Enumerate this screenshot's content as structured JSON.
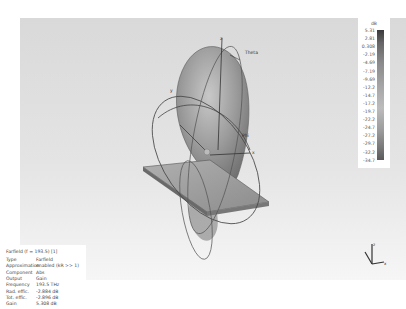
{
  "viewport": {
    "axis_labels": {
      "x": "x",
      "y": "y",
      "z": "z",
      "theta": "Theta",
      "phi": "Phi"
    }
  },
  "legend": {
    "unit": "dB",
    "ticks": [
      "5.31",
      "2.81",
      "0.308",
      "-2.19",
      "-4.69",
      "-7.19",
      "-9.69",
      "-12.2",
      "-14.7",
      "-17.2",
      "-19.7",
      "-22.2",
      "-24.7",
      "-27.2",
      "-29.7",
      "-32.2",
      "-34.7"
    ]
  },
  "info_panel": {
    "title": "Farfield (f = 193.5) [1]",
    "rows": [
      {
        "key": "Type",
        "value": "Farfield"
      },
      {
        "key": "Approximation",
        "value": "enabled (kR >> 1)"
      },
      {
        "key": "Component",
        "value": "Abs"
      },
      {
        "key": "Output",
        "value": "Gain"
      },
      {
        "key": "Frequency",
        "value": "193.5 THz"
      },
      {
        "key": "Rad. effic.",
        "value": "-2.884 dB"
      },
      {
        "key": "Tot. effic.",
        "value": "-2.896 dB"
      },
      {
        "key": "Gain",
        "value": "5.308 dB"
      }
    ]
  },
  "orientation_widget": {
    "x": "x",
    "y": "y",
    "z": "z"
  }
}
